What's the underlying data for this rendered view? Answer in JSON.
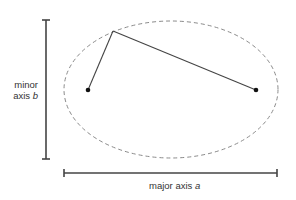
{
  "diagram": {
    "type": "ellipse-axes-illustration",
    "colors": {
      "background": "#ffffff",
      "ellipse_stroke": "#8a8a8a",
      "lines": "#444444",
      "foci": "#111111",
      "text": "#333333"
    },
    "ellipse": {
      "cx": 171,
      "cy": 89.5,
      "rx": 107,
      "ry": 68.5,
      "style": "dashed"
    },
    "foci": [
      {
        "name": "left-focus",
        "x": 88,
        "y": 90
      },
      {
        "name": "right-focus",
        "x": 256,
        "y": 90
      }
    ],
    "point_on_ellipse": {
      "x": 113,
      "y": 31
    },
    "minor_axis_bar": {
      "x": 46,
      "y1": 20,
      "y2": 159
    },
    "major_axis_bar": {
      "y": 173,
      "x1": 64,
      "x2": 277
    },
    "labels": {
      "minor_line1": "minor",
      "minor_line2_text": "axis ",
      "minor_var": "b",
      "major_text": "major axis ",
      "major_var": "a"
    }
  }
}
